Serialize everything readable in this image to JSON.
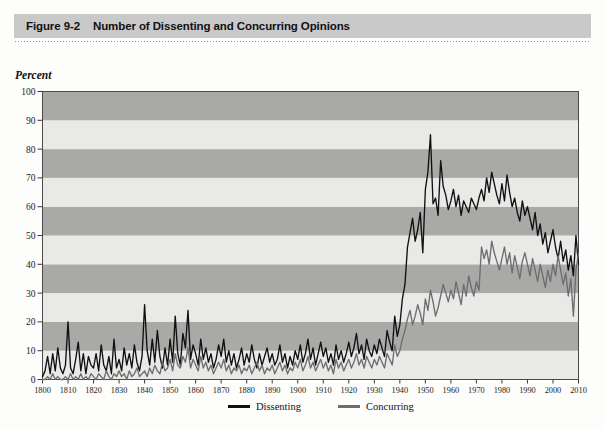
{
  "figure": {
    "number": "Figure 9-2",
    "title": "Number of Dissenting and Concurring Opinions"
  },
  "chart_data": {
    "type": "line",
    "title": "Number of Dissenting and Concurring Opinions",
    "xlabel": "",
    "ylabel": "Percent",
    "xlim": [
      1800,
      2010
    ],
    "ylim": [
      0,
      100
    ],
    "grid": "horizontal alternating shaded bands every 10 percent",
    "legend_position": "bottom-center",
    "ytick_labels": [
      "0",
      "10",
      "20",
      "30",
      "40",
      "50",
      "60",
      "70",
      "80",
      "90",
      "100"
    ],
    "ytick_values": [
      0,
      10,
      20,
      30,
      40,
      50,
      60,
      70,
      80,
      90,
      100
    ],
    "xtick_labels": [
      "1800",
      "1810",
      "1820",
      "1830",
      "1840",
      "1850",
      "1860",
      "1870",
      "1880",
      "1890",
      "1900",
      "1910",
      "1920",
      "1930",
      "1940",
      "1950",
      "1960",
      "1970",
      "1980",
      "1990",
      "2000",
      "2010"
    ],
    "xtick_values": [
      1800,
      1810,
      1820,
      1830,
      1840,
      1850,
      1860,
      1870,
      1880,
      1890,
      1900,
      1910,
      1920,
      1930,
      1940,
      1950,
      1960,
      1970,
      1980,
      1990,
      2000,
      2010
    ],
    "colors": {
      "dissenting": "#111111",
      "concurring": "#6e6e6e",
      "band_light": "#e9e9e7",
      "band_dark": "#a9a9a7",
      "banner": "#c9c9c9"
    },
    "series": [
      {
        "name": "Dissenting",
        "color": "#111111",
        "x": [
          1800,
          1801,
          1802,
          1803,
          1804,
          1805,
          1806,
          1807,
          1808,
          1809,
          1810,
          1811,
          1812,
          1813,
          1814,
          1815,
          1816,
          1817,
          1818,
          1819,
          1820,
          1821,
          1822,
          1823,
          1824,
          1825,
          1826,
          1827,
          1828,
          1829,
          1830,
          1831,
          1832,
          1833,
          1834,
          1835,
          1836,
          1837,
          1838,
          1839,
          1840,
          1841,
          1842,
          1843,
          1844,
          1845,
          1846,
          1847,
          1848,
          1849,
          1850,
          1851,
          1852,
          1853,
          1854,
          1855,
          1856,
          1857,
          1858,
          1859,
          1860,
          1861,
          1862,
          1863,
          1864,
          1865,
          1866,
          1867,
          1868,
          1869,
          1870,
          1871,
          1872,
          1873,
          1874,
          1875,
          1876,
          1877,
          1878,
          1879,
          1880,
          1881,
          1882,
          1883,
          1884,
          1885,
          1886,
          1887,
          1888,
          1889,
          1890,
          1891,
          1892,
          1893,
          1894,
          1895,
          1896,
          1897,
          1898,
          1899,
          1900,
          1901,
          1902,
          1903,
          1904,
          1905,
          1906,
          1907,
          1908,
          1909,
          1910,
          1911,
          1912,
          1913,
          1914,
          1915,
          1916,
          1917,
          1918,
          1919,
          1920,
          1921,
          1922,
          1923,
          1924,
          1925,
          1926,
          1927,
          1928,
          1929,
          1930,
          1931,
          1932,
          1933,
          1934,
          1935,
          1936,
          1937,
          1938,
          1939,
          1940,
          1941,
          1942,
          1943,
          1944,
          1945,
          1946,
          1947,
          1948,
          1949,
          1950,
          1951,
          1952,
          1953,
          1954,
          1955,
          1956,
          1957,
          1958,
          1959,
          1960,
          1961,
          1962,
          1963,
          1964,
          1965,
          1966,
          1967,
          1968,
          1969,
          1970,
          1971,
          1972,
          1973,
          1974,
          1975,
          1976,
          1977,
          1978,
          1979,
          1980,
          1981,
          1982,
          1983,
          1984,
          1985,
          1986,
          1987,
          1988,
          1989,
          1990,
          1991,
          1992,
          1993,
          1994,
          1995,
          1996,
          1997,
          1998,
          1999,
          2000,
          2001,
          2002,
          2003,
          2004,
          2005,
          2006,
          2007,
          2008,
          2009,
          2010
        ],
        "values": [
          1,
          3,
          8,
          2,
          9,
          3,
          11,
          4,
          2,
          5,
          20,
          4,
          2,
          7,
          13,
          3,
          9,
          2,
          8,
          5,
          4,
          9,
          3,
          12,
          5,
          3,
          8,
          2,
          14,
          4,
          7,
          3,
          11,
          5,
          9,
          4,
          12,
          6,
          3,
          8,
          26,
          10,
          5,
          14,
          6,
          17,
          8,
          4,
          11,
          5,
          14,
          6,
          22,
          9,
          5,
          16,
          11,
          24,
          7,
          12,
          9,
          5,
          14,
          7,
          11,
          6,
          9,
          4,
          7,
          12,
          8,
          14,
          6,
          10,
          5,
          9,
          4,
          7,
          11,
          5,
          9,
          6,
          12,
          7,
          4,
          9,
          5,
          8,
          11,
          6,
          9,
          5,
          7,
          12,
          6,
          9,
          4,
          8,
          5,
          10,
          7,
          12,
          6,
          9,
          14,
          7,
          11,
          5,
          9,
          13,
          8,
          11,
          6,
          9,
          5,
          12,
          7,
          10,
          6,
          9,
          13,
          8,
          11,
          16,
          9,
          12,
          7,
          14,
          10,
          8,
          12,
          9,
          14,
          11,
          8,
          17,
          13,
          10,
          22,
          15,
          19,
          28,
          33,
          46,
          51,
          56,
          48,
          52,
          58,
          44,
          66,
          72,
          85,
          61,
          63,
          57,
          76,
          67,
          64,
          59,
          62,
          66,
          60,
          64,
          57,
          62,
          60,
          58,
          63,
          61,
          59,
          63,
          66,
          62,
          70,
          65,
          72,
          68,
          64,
          61,
          68,
          62,
          71,
          65,
          60,
          63,
          58,
          55,
          62,
          57,
          60,
          56,
          52,
          58,
          50,
          54,
          47,
          51,
          44,
          48,
          52,
          46,
          42,
          48,
          41,
          45,
          38,
          43,
          36,
          50,
          40
        ]
      },
      {
        "name": "Concurring",
        "color": "#6e6e6e",
        "x": [
          1800,
          1801,
          1802,
          1803,
          1804,
          1805,
          1806,
          1807,
          1808,
          1809,
          1810,
          1811,
          1812,
          1813,
          1814,
          1815,
          1816,
          1817,
          1818,
          1819,
          1820,
          1821,
          1822,
          1823,
          1824,
          1825,
          1826,
          1827,
          1828,
          1829,
          1830,
          1831,
          1832,
          1833,
          1834,
          1835,
          1836,
          1837,
          1838,
          1839,
          1840,
          1841,
          1842,
          1843,
          1844,
          1845,
          1846,
          1847,
          1848,
          1849,
          1850,
          1851,
          1852,
          1853,
          1854,
          1855,
          1856,
          1857,
          1858,
          1859,
          1860,
          1861,
          1862,
          1863,
          1864,
          1865,
          1866,
          1867,
          1868,
          1869,
          1870,
          1871,
          1872,
          1873,
          1874,
          1875,
          1876,
          1877,
          1878,
          1879,
          1880,
          1881,
          1882,
          1883,
          1884,
          1885,
          1886,
          1887,
          1888,
          1889,
          1890,
          1891,
          1892,
          1893,
          1894,
          1895,
          1896,
          1897,
          1898,
          1899,
          1900,
          1901,
          1902,
          1903,
          1904,
          1905,
          1906,
          1907,
          1908,
          1909,
          1910,
          1911,
          1912,
          1913,
          1914,
          1915,
          1916,
          1917,
          1918,
          1919,
          1920,
          1921,
          1922,
          1923,
          1924,
          1925,
          1926,
          1927,
          1928,
          1929,
          1930,
          1931,
          1932,
          1933,
          1934,
          1935,
          1936,
          1937,
          1938,
          1939,
          1940,
          1941,
          1942,
          1943,
          1944,
          1945,
          1946,
          1947,
          1948,
          1949,
          1950,
          1951,
          1952,
          1953,
          1954,
          1955,
          1956,
          1957,
          1958,
          1959,
          1960,
          1961,
          1962,
          1963,
          1964,
          1965,
          1966,
          1967,
          1968,
          1969,
          1970,
          1971,
          1972,
          1973,
          1974,
          1975,
          1976,
          1977,
          1978,
          1979,
          1980,
          1981,
          1982,
          1983,
          1984,
          1985,
          1986,
          1987,
          1988,
          1989,
          1990,
          1991,
          1992,
          1993,
          1994,
          1995,
          1996,
          1997,
          1998,
          1999,
          2000,
          2001,
          2002,
          2003,
          2004,
          2005,
          2006,
          2007,
          2008,
          2009,
          2010
        ],
        "values": [
          0,
          0,
          1,
          0,
          2,
          0,
          1,
          0,
          0,
          1,
          0,
          2,
          0,
          1,
          0,
          2,
          0,
          1,
          0,
          2,
          1,
          0,
          2,
          1,
          0,
          3,
          1,
          0,
          2,
          1,
          3,
          1,
          2,
          0,
          3,
          1,
          2,
          4,
          1,
          2,
          3,
          1,
          4,
          2,
          5,
          3,
          2,
          6,
          3,
          4,
          7,
          3,
          9,
          5,
          4,
          8,
          6,
          11,
          4,
          7,
          5,
          3,
          8,
          4,
          6,
          3,
          5,
          2,
          4,
          6,
          4,
          7,
          3,
          5,
          2,
          4,
          3,
          5,
          2,
          4,
          3,
          5,
          2,
          4,
          6,
          3,
          5,
          2,
          4,
          3,
          5,
          2,
          4,
          6,
          3,
          5,
          2,
          4,
          3,
          6,
          4,
          7,
          3,
          5,
          8,
          4,
          6,
          3,
          5,
          7,
          4,
          6,
          3,
          5,
          2,
          7,
          4,
          6,
          3,
          5,
          7,
          4,
          6,
          9,
          5,
          7,
          4,
          8,
          6,
          4,
          7,
          5,
          8,
          6,
          4,
          9,
          7,
          5,
          12,
          8,
          10,
          14,
          17,
          21,
          24,
          19,
          22,
          26,
          23,
          19,
          28,
          24,
          31,
          27,
          22,
          25,
          29,
          33,
          30,
          27,
          31,
          28,
          34,
          30,
          26,
          33,
          29,
          36,
          32,
          29,
          34,
          31,
          46,
          42,
          45,
          40,
          48,
          44,
          41,
          38,
          42,
          46,
          40,
          44,
          37,
          43,
          39,
          35,
          41,
          44,
          40,
          36,
          42,
          38,
          34,
          40,
          36,
          32,
          38,
          34,
          40,
          36,
          43,
          38,
          33,
          37,
          29,
          35,
          22,
          38,
          44
        ]
      }
    ]
  },
  "legend": {
    "items": [
      {
        "label": "Dissenting",
        "color": "#111111"
      },
      {
        "label": "Concurring",
        "color": "#6e6e6e"
      }
    ]
  }
}
